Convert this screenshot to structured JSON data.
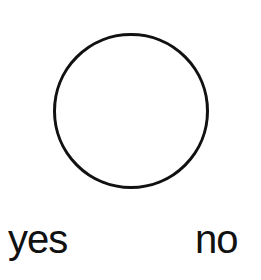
{
  "figure": {
    "shape": "circle",
    "stroke_color": "#111111",
    "fill_color": "#ffffff"
  },
  "options": [
    {
      "label": "yes"
    },
    {
      "label": "no"
    }
  ]
}
